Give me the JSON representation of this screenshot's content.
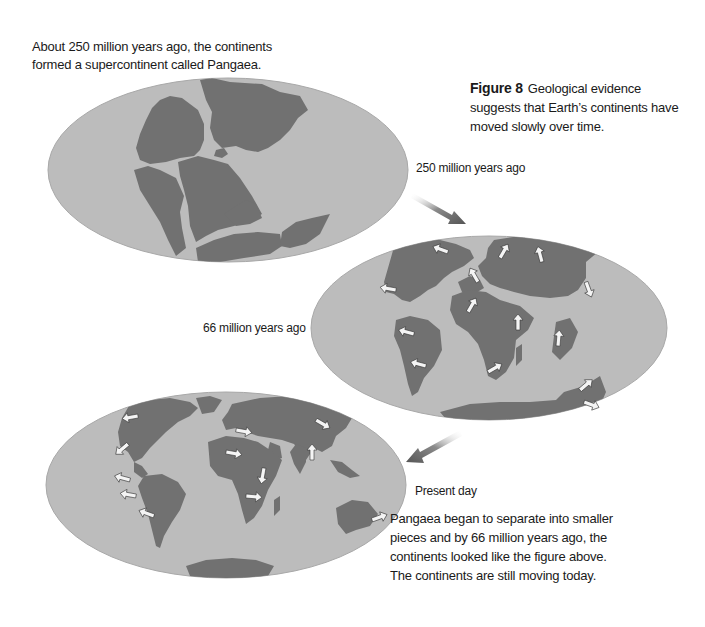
{
  "figure": {
    "number_label": "Figure 8",
    "caption": "Geological evidence suggests that Earth’s continents have moved slowly over time."
  },
  "intro_text_lines": [
    "About 250 million years ago, the continents",
    "formed a supercontinent called Pangaea."
  ],
  "maps": [
    {
      "id": "pangaea",
      "label": "250 million years ago",
      "description": "Supercontinent Pangaea map (oval projection)"
    },
    {
      "id": "cretaceous",
      "label": "66 million years ago",
      "description": "Continents partially separated, with motion arrows"
    },
    {
      "id": "present",
      "label": "Present day",
      "description": "Modern world map with plate-motion arrows"
    }
  ],
  "outro_text_lines": [
    "Pangaea began to separate into smaller",
    "pieces and by 66 million years ago, the",
    "continents looked like the figure above.",
    "The continents are still moving today."
  ],
  "colors": {
    "ocean": "#bcbcbc",
    "land": "#717171",
    "arrow": "#6a6a6a",
    "text": "#1a1a1a"
  }
}
